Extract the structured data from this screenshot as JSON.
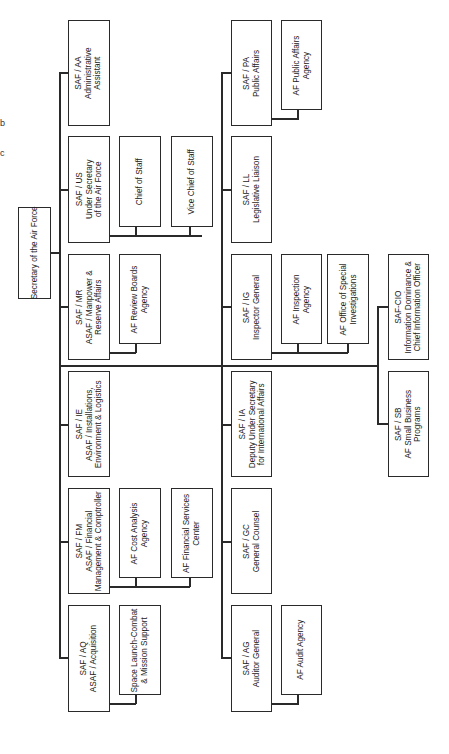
{
  "chart_title_fragments": [
    "b",
    "c"
  ],
  "root": {
    "label": "Secretary of the Air Force"
  },
  "left_branch": [
    {
      "code": "SAF / AA",
      "lines": [
        "SAF / AA",
        "Administrative",
        "Assistant"
      ],
      "children": []
    },
    {
      "code": "SAF / US",
      "lines": [
        "SAF / US",
        "Under Secretary",
        "of the Air Force"
      ],
      "children": [
        {
          "lines": [
            "Chief of Staff"
          ]
        },
        {
          "lines": [
            "Vice Chief of Staff"
          ]
        }
      ]
    },
    {
      "code": "SAF / MR",
      "lines": [
        "SAF / MR",
        "ASAF / Manpower &",
        "Reserve Affairs"
      ],
      "children": [
        {
          "lines": [
            "AF Review Boards",
            "Agency"
          ]
        }
      ]
    },
    {
      "code": "SAF / IE",
      "lines": [
        "SAF / IE",
        "ASAF / Installations,",
        "Environment & Logistics"
      ],
      "children": []
    },
    {
      "code": "SAF / FM",
      "lines": [
        "SAF / FM",
        "ASAF / Financial",
        "Management & Comptroller"
      ],
      "children": [
        {
          "lines": [
            "AF Cost Analysis",
            "Agency"
          ]
        },
        {
          "lines": [
            "AF Financial Services",
            "Center"
          ]
        }
      ]
    },
    {
      "code": "SAF / AQ",
      "lines": [
        "SAF / AQ",
        "ASAF / Acquisition"
      ],
      "children": [
        {
          "lines": [
            "Space Launch-Combat",
            "& Mission Support"
          ]
        }
      ]
    }
  ],
  "right_branch": [
    {
      "code": "SAF / PA",
      "lines": [
        "SAF / PA",
        "Public Affairs"
      ],
      "children": [
        {
          "lines": [
            "AF Public Affairs",
            "Agency"
          ]
        }
      ]
    },
    {
      "code": "SAF / LL",
      "lines": [
        "SAF / LL",
        "Legislative Liaison"
      ],
      "children": []
    },
    {
      "code": "SAF / IG",
      "lines": [
        "SAF / IG",
        "Inspector General"
      ],
      "children": [
        {
          "lines": [
            "AF Inspection",
            "Agency"
          ]
        },
        {
          "lines": [
            "AF Office of Special",
            "Investigations"
          ]
        }
      ]
    },
    {
      "code": "SAF / IA",
      "lines": [
        "SAF / IA",
        "Deputy Under Secretary",
        "for International Affairs"
      ],
      "children": []
    },
    {
      "code": "SAF / GC",
      "lines": [
        "SAF / GC",
        "General Counsel"
      ],
      "children": []
    },
    {
      "code": "SAF / AG",
      "lines": [
        "SAF / AG",
        "Auditor General"
      ],
      "children": [
        {
          "lines": [
            "AF Audit Agency"
          ]
        }
      ]
    }
  ],
  "far_right_branch": [
    {
      "code": "SAF-CIO",
      "lines": [
        "SAF-CIO",
        "Information Dominance &",
        "Chief Information Officer"
      ]
    },
    {
      "code": "SAF / SB",
      "lines": [
        "SAF / SB",
        "AF Small Business",
        "Programs"
      ]
    }
  ]
}
